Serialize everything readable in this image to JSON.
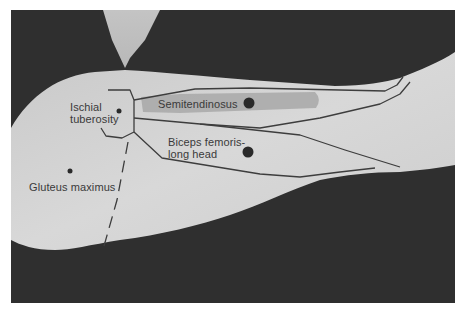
{
  "figure": {
    "type": "anatomical palpation diagram",
    "colors": {
      "background_dark": "#2e2e2e",
      "skin": "#cfcfcf",
      "skin_light": "#dcdcdc",
      "muscle_highlight": "#a9a9a9",
      "outline": "#3d3d3d",
      "marker_dot": "#2a2a2a",
      "label_text": "#3a3a3a",
      "border": "#ffffff"
    }
  },
  "labels": {
    "ischial_tuberosity_line1": "Ischial",
    "ischial_tuberosity_line2": "tuberosity",
    "semitendinosus": "Semitendinosus",
    "biceps_femoris_line1": "Biceps femoris-",
    "biceps_femoris_line2": "long head",
    "gluteus_maximus": "Gluteus maximus"
  },
  "markers": [
    {
      "name": "ischial-tuberosity",
      "x": 119,
      "y": 111,
      "size": "small"
    },
    {
      "name": "semitendinosus",
      "x": 249,
      "y": 103,
      "size": "large"
    },
    {
      "name": "biceps-femoris-long-head",
      "x": 248,
      "y": 152,
      "size": "large"
    },
    {
      "name": "gluteus-maximus",
      "x": 70,
      "y": 171,
      "size": "small"
    }
  ]
}
